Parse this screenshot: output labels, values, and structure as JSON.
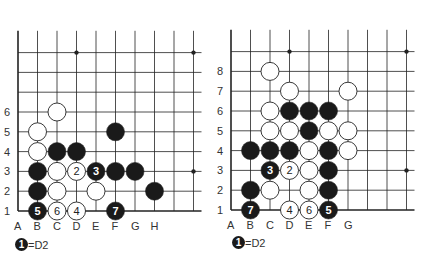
{
  "diagrams": [
    {
      "id": "left",
      "origin": {
        "x": 18,
        "y": 211
      },
      "spacing": {
        "x": 19.5,
        "y": 19.8
      },
      "cols": 10,
      "rows": 10,
      "col_labels": [
        "A",
        "B",
        "C",
        "D",
        "E",
        "F",
        "G",
        "H"
      ],
      "row_labels": [
        "1",
        "2",
        "3",
        "4",
        "5",
        "6"
      ],
      "star_points": [
        [
          4,
          10
        ],
        [
          10,
          10
        ],
        [
          10,
          4
        ]
      ],
      "stones": [
        {
          "color": "white",
          "col": 3,
          "row": 6
        },
        {
          "color": "white",
          "col": 2,
          "row": 5
        },
        {
          "color": "black",
          "col": 6,
          "row": 5
        },
        {
          "color": "white",
          "col": 2,
          "row": 4
        },
        {
          "color": "black",
          "col": 3,
          "row": 4
        },
        {
          "color": "black",
          "col": 4,
          "row": 4
        },
        {
          "color": "black",
          "col": 2,
          "row": 3
        },
        {
          "color": "white",
          "col": 3,
          "row": 3
        },
        {
          "color": "white",
          "col": 4,
          "row": 3,
          "label": "2"
        },
        {
          "color": "black",
          "col": 5,
          "row": 3,
          "label": "3"
        },
        {
          "color": "black",
          "col": 6,
          "row": 3
        },
        {
          "color": "black",
          "col": 7,
          "row": 3
        },
        {
          "color": "black",
          "col": 2,
          "row": 2
        },
        {
          "color": "white",
          "col": 3,
          "row": 2
        },
        {
          "color": "white",
          "col": 5,
          "row": 2
        },
        {
          "color": "black",
          "col": 8,
          "row": 2
        },
        {
          "color": "black",
          "col": 2,
          "row": 1,
          "label": "5"
        },
        {
          "color": "white",
          "col": 3,
          "row": 1,
          "label": "6"
        },
        {
          "color": "white",
          "col": 4,
          "row": 1,
          "label": "4"
        },
        {
          "color": "black",
          "col": 6,
          "row": 1,
          "label": "7"
        }
      ],
      "note": {
        "stone_label": "1",
        "text": "=D2"
      }
    },
    {
      "id": "right",
      "origin": {
        "x": 231,
        "y": 210
      },
      "spacing": {
        "x": 19.5,
        "y": 19.8
      },
      "cols": 10,
      "rows": 10,
      "col_labels": [
        "A",
        "B",
        "C",
        "D",
        "E",
        "F",
        "G"
      ],
      "row_labels": [
        "1",
        "2",
        "3",
        "4",
        "5",
        "6",
        "7",
        "8"
      ],
      "star_points": [
        [
          4,
          10
        ],
        [
          10,
          10
        ],
        [
          10,
          4
        ]
      ],
      "stones": [
        {
          "color": "white",
          "col": 3,
          "row": 8
        },
        {
          "color": "white",
          "col": 4,
          "row": 7
        },
        {
          "color": "white",
          "col": 7,
          "row": 7
        },
        {
          "color": "white",
          "col": 3,
          "row": 6
        },
        {
          "color": "black",
          "col": 4,
          "row": 6
        },
        {
          "color": "black",
          "col": 5,
          "row": 6
        },
        {
          "color": "black",
          "col": 6,
          "row": 6
        },
        {
          "color": "white",
          "col": 3,
          "row": 5
        },
        {
          "color": "white",
          "col": 4,
          "row": 5
        },
        {
          "color": "black",
          "col": 5,
          "row": 5
        },
        {
          "color": "white",
          "col": 6,
          "row": 5
        },
        {
          "color": "white",
          "col": 7,
          "row": 5
        },
        {
          "color": "black",
          "col": 2,
          "row": 4
        },
        {
          "color": "black",
          "col": 3,
          "row": 4
        },
        {
          "color": "black",
          "col": 4,
          "row": 4
        },
        {
          "color": "white",
          "col": 5,
          "row": 4
        },
        {
          "color": "black",
          "col": 6,
          "row": 4
        },
        {
          "color": "white",
          "col": 7,
          "row": 4
        },
        {
          "color": "black",
          "col": 3,
          "row": 3,
          "label": "3"
        },
        {
          "color": "white",
          "col": 4,
          "row": 3,
          "label": "2"
        },
        {
          "color": "white",
          "col": 5,
          "row": 3
        },
        {
          "color": "black",
          "col": 6,
          "row": 3
        },
        {
          "color": "black",
          "col": 2,
          "row": 2
        },
        {
          "color": "white",
          "col": 3,
          "row": 2
        },
        {
          "color": "white",
          "col": 5,
          "row": 2
        },
        {
          "color": "black",
          "col": 6,
          "row": 2
        },
        {
          "color": "black",
          "col": 2,
          "row": 1,
          "label": "7"
        },
        {
          "color": "white",
          "col": 4,
          "row": 1,
          "label": "4"
        },
        {
          "color": "white",
          "col": 5,
          "row": 1,
          "label": "6"
        },
        {
          "color": "black",
          "col": 6,
          "row": 1,
          "label": "5"
        }
      ],
      "note": {
        "stone_label": "1",
        "text": "=D2"
      }
    }
  ],
  "colors": {
    "line": "#222222",
    "black_stone": "#1a1a1a",
    "white_stone": "#ffffff",
    "label": "#333333"
  }
}
